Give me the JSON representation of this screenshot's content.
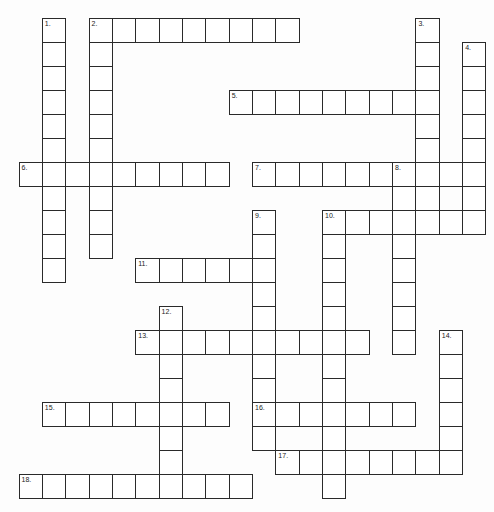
{
  "puzzle": {
    "type": "crossword",
    "grid": {
      "origin_x": 19,
      "origin_y": 18,
      "cell_w": 23.35,
      "cell_h": 24,
      "cols": 20,
      "rows": 20
    },
    "colors": {
      "line": "#2a2a2a",
      "cell_bg": "#ffffff",
      "page_bg": "#fdfdfd",
      "number": "#222222"
    },
    "entries": [
      {
        "number": "1.",
        "direction": "down",
        "row": 0,
        "col": 1,
        "length": 11
      },
      {
        "number": "2.",
        "direction": "across",
        "row": 0,
        "col": 3,
        "length": 9
      },
      {
        "number": "2.",
        "direction": "down",
        "row": 0,
        "col": 3,
        "length": 10
      },
      {
        "number": "3.",
        "direction": "down",
        "row": 0,
        "col": 17,
        "length": 9
      },
      {
        "number": "4.",
        "direction": "down",
        "row": 1,
        "col": 19,
        "length": 8
      },
      {
        "number": "5.",
        "direction": "across",
        "row": 3,
        "col": 9,
        "length": 9
      },
      {
        "number": "6.",
        "direction": "across",
        "row": 6,
        "col": 0,
        "length": 9
      },
      {
        "number": "7.",
        "direction": "across",
        "row": 6,
        "col": 10,
        "length": 10
      },
      {
        "number": "8.",
        "direction": "down",
        "row": 6,
        "col": 16,
        "length": 8
      },
      {
        "number": "9.",
        "direction": "down",
        "row": 8,
        "col": 10,
        "length": 10
      },
      {
        "number": "10.",
        "direction": "across",
        "row": 8,
        "col": 13,
        "length": 7
      },
      {
        "number": "10.",
        "direction": "down",
        "row": 8,
        "col": 13,
        "length": 12
      },
      {
        "number": "11.",
        "direction": "across",
        "row": 10,
        "col": 5,
        "length": 6
      },
      {
        "number": "12.",
        "direction": "down",
        "row": 12,
        "col": 6,
        "length": 8
      },
      {
        "number": "13.",
        "direction": "across",
        "row": 13,
        "col": 5,
        "length": 10
      },
      {
        "number": "14.",
        "direction": "down",
        "row": 13,
        "col": 18,
        "length": 6
      },
      {
        "number": "15.",
        "direction": "across",
        "row": 16,
        "col": 1,
        "length": 8
      },
      {
        "number": "16.",
        "direction": "across",
        "row": 16,
        "col": 10,
        "length": 7
      },
      {
        "number": "17.",
        "direction": "across",
        "row": 18,
        "col": 11,
        "length": 8
      },
      {
        "number": "18.",
        "direction": "across",
        "row": 19,
        "col": 0,
        "length": 10
      }
    ]
  }
}
